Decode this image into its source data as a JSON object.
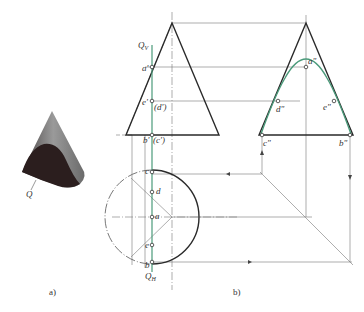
{
  "figure": {
    "panel_a": {
      "caption": "a)",
      "plane_label": "Q"
    },
    "panel_b": {
      "caption": "b)",
      "front_view": {
        "plane_label": "Q",
        "plane_sub": "V",
        "points": [
          "a'",
          "e'",
          "(d')",
          "b'",
          "(c')"
        ]
      },
      "side_view": {
        "points": [
          "a\"",
          "d\"",
          "e\"",
          "c\"",
          "b\""
        ]
      },
      "top_view": {
        "plane_label": "Q",
        "plane_sub": "H",
        "points": [
          "c",
          "d",
          "a",
          "e",
          "b"
        ]
      }
    },
    "colors": {
      "outline": "#2a2a2a",
      "construction": "#777777",
      "section_curve": "#4a9a7a",
      "solid_dark": "#2b1e1e",
      "solid_light": "#8a8a8a"
    }
  }
}
